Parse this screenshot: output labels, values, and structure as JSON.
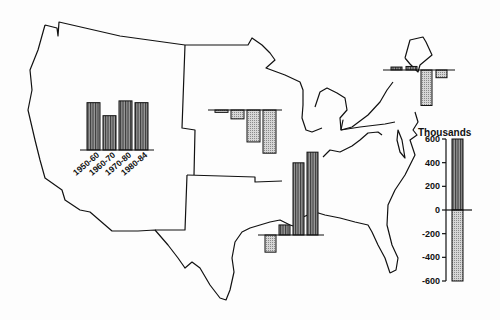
{
  "chart_data": {
    "type": "bar",
    "ylabel": "Thousands",
    "ylim": [
      -600,
      600
    ],
    "scale_ticks": [
      600,
      400,
      200,
      0,
      -200,
      -400,
      -600
    ],
    "scale_bar": {
      "top": 600,
      "bottom": -600
    },
    "categories": [
      "1950-60",
      "1960-70",
      "1970-80",
      "1980-84"
    ],
    "grid": false,
    "legend_position": "right",
    "series": [
      {
        "name": "West",
        "values": [
          400,
          290,
          415,
          400
        ]
      },
      {
        "name": "Midwest",
        "values": [
          -20,
          -75,
          -270,
          -365
        ]
      },
      {
        "name": "South",
        "values": [
          -145,
          85,
          610,
          700
        ]
      },
      {
        "name": "Northeast",
        "values": [
          25,
          30,
          -300,
          -65
        ]
      }
    ],
    "encoding": {
      "positive": "vertical-stripe fill",
      "negative": "stippled fill"
    }
  },
  "legend": {
    "title": "Thousands"
  }
}
